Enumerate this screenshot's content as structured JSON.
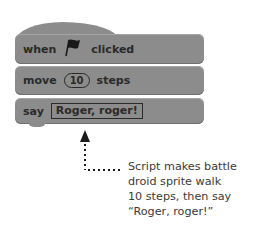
{
  "script": {
    "hat_block": {
      "when_label": "when",
      "icon": "green-flag-icon",
      "clicked_label": "clicked"
    },
    "move_block": {
      "move_label": "move",
      "steps_value": "10",
      "steps_label": "steps"
    },
    "say_block": {
      "say_label": "say",
      "message": "Roger, roger!"
    }
  },
  "annotation": {
    "lines": [
      "Script makes battle",
      "droid sprite walk",
      "10 steps, then say",
      "“Roger, roger!”"
    ]
  },
  "colors": {
    "block": "#8c8c8c",
    "text": "#2a2a2a",
    "caption": "#3a3a3a"
  }
}
